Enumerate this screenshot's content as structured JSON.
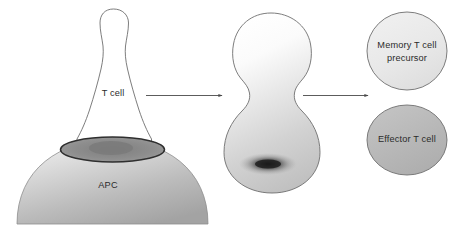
{
  "figure": {
    "background_color": "#ffffff",
    "outline_color": "#6e6e6e",
    "label_color": "#2b2b2b"
  },
  "labels": {
    "t_cell": "T cell",
    "apc": "APC",
    "memory_line1": "Memory T cell",
    "memory_line2": "precursor",
    "effector": "Effector T cell"
  },
  "stages": [
    {
      "name": "t-cell-apc-conjugate",
      "shapes": [
        "t-cell-body",
        "apc-dome",
        "immune-synapse"
      ],
      "label": "T cell"
    },
    {
      "name": "dividing-t-cell",
      "shapes": [
        "dividing-cell-body",
        "polarized-dark-pole"
      ],
      "label": ""
    },
    {
      "name": "daughter-cells",
      "shapes": [
        "memory-precursor-circle",
        "effector-circle"
      ],
      "label": ""
    }
  ],
  "arrows": [
    {
      "name": "arrow-1",
      "from": "t-cell-apc-conjugate",
      "to": "dividing-t-cell"
    },
    {
      "name": "arrow-2",
      "from": "dividing-t-cell",
      "to": "daughter-cells"
    }
  ],
  "colors": {
    "apc_light": "#e4e4e4",
    "apc_mid": "#b9b9b9",
    "apc_dark": "#9a9a9a",
    "synapse_ring": "#3b3b3b",
    "synapse_fill": "#8e8e8e",
    "t_cell_fill": "#ffffff",
    "dividing_top": "#ffffff",
    "dividing_bottom": "#c6c6c6",
    "dark_pole": "#1c1c1c",
    "memory_fill": "#e9e9e9",
    "effector_fill": "#b7b7b7",
    "outline": "#6e6e6e",
    "arrow": "#555555"
  }
}
